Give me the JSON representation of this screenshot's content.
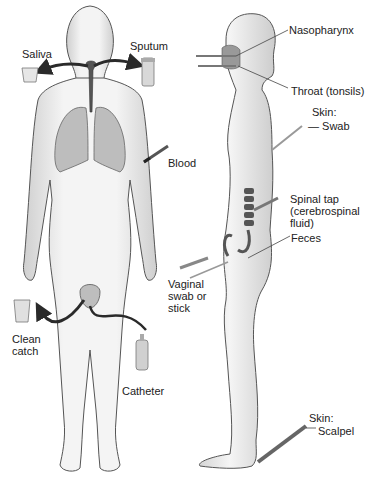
{
  "diagram": {
    "type": "specimen-collection-sites",
    "colors": {
      "body_fill": "#ececec",
      "body_stroke": "#555555",
      "organ_fill": "#bdbdbd",
      "arrow": "#2a2a2a",
      "leader_line": "#444444",
      "text": "#222222"
    },
    "front_view_labels": {
      "saliva": "Saliva",
      "sputum": "Sputum",
      "blood": "Blood",
      "clean_catch": "Clean\ncatch",
      "catheter": "Catheter"
    },
    "side_view_labels": {
      "nasopharynx": "Nasopharynx",
      "throat": "Throat (tonsils)",
      "skin_swab_header": "Skin:",
      "skin_swab": "— Swab",
      "spinal_tap": "Spinal tap\n(cerebrospinal\nfluid)",
      "feces": "Feces",
      "vaginal": "Vaginal\nswab or\nstick",
      "skin_scalpel_header": "Skin:",
      "skin_scalpel": "Scalpel"
    }
  }
}
